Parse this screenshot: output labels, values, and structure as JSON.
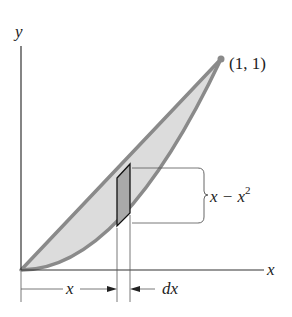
{
  "diagram": {
    "axis_labels": {
      "x": "x",
      "y": "y"
    },
    "point_label": "(1, 1)",
    "strip_height_label": {
      "base": "x − x",
      "exponent": "2"
    },
    "width_label": "x",
    "dx_label": "dx",
    "curves": [
      "y = x",
      "y = x^2"
    ],
    "colors": {
      "region_fill": "#dcdcdc",
      "curve_stroke": "#8a8a8a",
      "strip_fill": "#a9a9a9",
      "axis": "#333333"
    }
  }
}
